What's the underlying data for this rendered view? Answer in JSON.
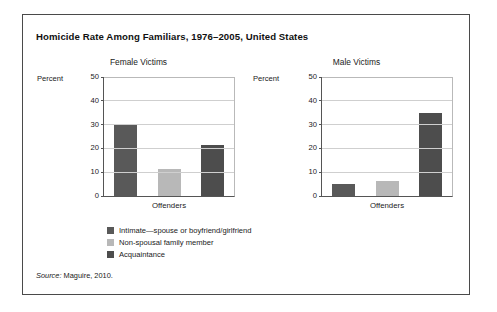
{
  "figure": {
    "title": "Homicide Rate Among Familiars, 1976–2005, United States",
    "source_word": "Source:",
    "source_text": " Maguire, 2010."
  },
  "legend": {
    "items": [
      {
        "label": "Intimate—spouse or boyfriend/girlfriend",
        "color": "#595959"
      },
      {
        "label": "Non-spousal family member",
        "color": "#b8b8b8"
      },
      {
        "label": "Acquaintance",
        "color": "#4d4d4d"
      }
    ]
  },
  "colors": {
    "intimate": "#595959",
    "non_spousal": "#b8b8b8",
    "acquaintance": "#4d4d4d",
    "frame": "#4a4a4a",
    "gridline": "#cfcfcf",
    "axis": "#555555"
  },
  "chart_data": [
    {
      "type": "bar",
      "title": "Female Victims",
      "xlabel": "Offenders",
      "ylabel": "Percent",
      "categories": [
        "Intimate—spouse or boyfriend/girlfriend",
        "Non-spousal family member",
        "Acquaintance"
      ],
      "values": [
        30,
        11.5,
        21.5
      ],
      "colors": [
        "#595959",
        "#b8b8b8",
        "#4d4d4d"
      ],
      "ylim": [
        0,
        50
      ],
      "yticks": [
        0,
        10,
        20,
        30,
        40,
        50
      ],
      "grid": true,
      "legend_position": "below"
    },
    {
      "type": "bar",
      "title": "Male Victims",
      "xlabel": "Offenders",
      "ylabel": "Percent",
      "categories": [
        "Intimate—spouse or boyfriend/girlfriend",
        "Non-spousal family member",
        "Acquaintance"
      ],
      "values": [
        5,
        6.5,
        35
      ],
      "colors": [
        "#595959",
        "#b8b8b8",
        "#4d4d4d"
      ],
      "ylim": [
        0,
        50
      ],
      "yticks": [
        0,
        10,
        20,
        30,
        40,
        50
      ],
      "grid": true,
      "legend_position": "below"
    }
  ]
}
